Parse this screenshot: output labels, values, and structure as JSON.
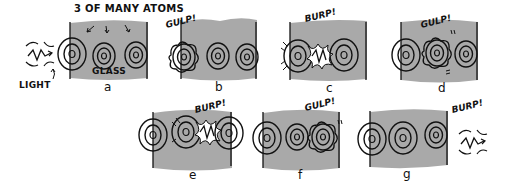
{
  "colors": {
    "glass": "#a9a9a9",
    "ink": "#111111",
    "background": "#ffffff",
    "flash": "#ffffff"
  },
  "labels": {
    "atoms_caption": "3 OF MANY ATOMS",
    "glass": "GLASS",
    "light": "LIGHT"
  },
  "panels": [
    {
      "id": "a",
      "letter": "a",
      "sound": ""
    },
    {
      "id": "b",
      "letter": "b",
      "sound": "GULP!"
    },
    {
      "id": "c",
      "letter": "c",
      "sound": "BURP!"
    },
    {
      "id": "d",
      "letter": "d",
      "sound": "GULP!"
    },
    {
      "id": "e",
      "letter": "e",
      "sound": "BURP!"
    },
    {
      "id": "f",
      "letter": "f",
      "sound": "GULP!"
    },
    {
      "id": "g",
      "letter": "g",
      "sound": "BURP!"
    }
  ]
}
